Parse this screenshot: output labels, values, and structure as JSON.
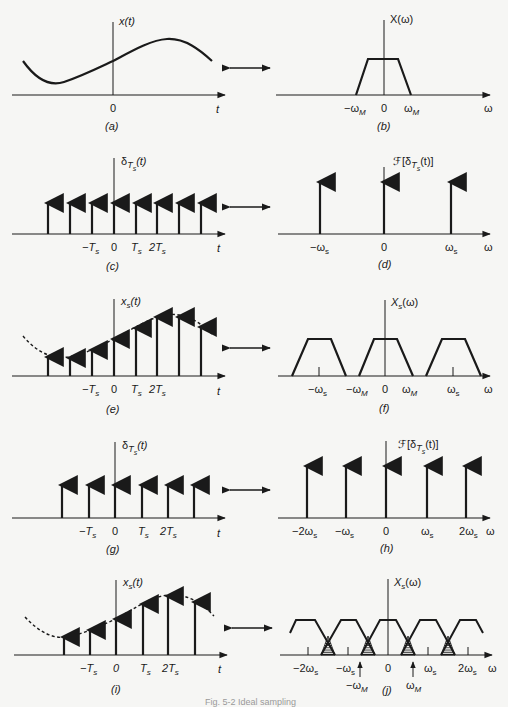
{
  "figure": {
    "caption": "Fig. 5-2 Ideal sampling",
    "colors": {
      "ink": "#1a1a1a",
      "background": "#f6f6f4",
      "hatch": "#1a1a1a"
    },
    "transform_arrow": "double-arrow",
    "panels": [
      {
        "id": "a",
        "label": "(a)",
        "domain": "time",
        "ylabel": "x(t)",
        "xlabel": "t",
        "ticks": [
          "0"
        ],
        "content": "continuous signal x(t), sinusoid-like curve"
      },
      {
        "id": "b",
        "label": "(b)",
        "domain": "frequency",
        "ylabel": "X(ω)",
        "xlabel": "ω",
        "ticks": [
          "−ωM",
          "0",
          "ωM"
        ],
        "content": "band-limited trapezoidal spectrum from −ωM to ωM"
      },
      {
        "id": "c",
        "label": "(c)",
        "domain": "time",
        "ylabel": "δTs(t)",
        "xlabel": "t",
        "ticks": [
          "−Ts",
          "0",
          "Ts",
          "2Ts"
        ],
        "content": "impulse train with period Ts (8 impulses shown)"
      },
      {
        "id": "d",
        "label": "(d)",
        "domain": "frequency",
        "ylabel": "ℱ[δTs(t)]",
        "xlabel": "ω",
        "ticks": [
          "−ωs",
          "0",
          "ωs"
        ],
        "content": "impulse train in frequency with spacing ωs (3 impulses)"
      },
      {
        "id": "e",
        "label": "(e)",
        "domain": "time",
        "ylabel": "xs(t)",
        "xlabel": "t",
        "ticks": [
          "−Ts",
          "0",
          "Ts",
          "2Ts"
        ],
        "content": "sampled signal: impulses weighted by x(t), envelope dashed"
      },
      {
        "id": "f",
        "label": "(f)",
        "domain": "frequency",
        "ylabel": "Xs(ω)",
        "xlabel": "ω",
        "ticks": [
          "−ωs",
          "−ωM",
          "0",
          "ωM",
          "ωs"
        ],
        "content": "replicated spectra at multiples of ωs, no overlap"
      },
      {
        "id": "g",
        "label": "(g)",
        "domain": "time",
        "ylabel": "δTs(t)",
        "xlabel": "t",
        "ticks": [
          "−Ts",
          "0",
          "Ts",
          "2Ts"
        ],
        "content": "impulse train with larger period Ts (6 impulses)"
      },
      {
        "id": "h",
        "label": "(h)",
        "domain": "frequency",
        "ylabel": "ℱ[δTs(t)]",
        "xlabel": "ω",
        "ticks": [
          "−2ωs",
          "−ωs",
          "0",
          "ωs",
          "2ωs"
        ],
        "content": "frequency impulse train with smaller spacing ωs (5 impulses)"
      },
      {
        "id": "i",
        "label": "(i)",
        "domain": "time",
        "ylabel": "xs(t)",
        "xlabel": "t",
        "ticks": [
          "−Ts",
          "0",
          "Ts",
          "2Ts"
        ],
        "content": "sampled signal with larger Ts, envelope dashed"
      },
      {
        "id": "j",
        "label": "(j)",
        "domain": "frequency",
        "ylabel": "Xs(ω)",
        "xlabel": "ω",
        "ticks": [
          "−2ωs",
          "−ωs",
          "0",
          "ωs",
          "2ωs"
        ],
        "markers": [
          "−ωM",
          "ωM"
        ],
        "content": "overlapping replicated spectra (aliasing), overlap regions hatched"
      }
    ]
  },
  "text": {
    "t": "t",
    "w": "ω",
    "zero": "0",
    "x_t": "x(t)",
    "X_w": "X(ω)",
    "delta": "δ",
    "Ts_sub_T": "T",
    "Ts_sub_s": "s",
    "paren_t": "(t)",
    "F_open": "ℱ[δ",
    "F_close": "(t)]",
    "xs": "x",
    "Xs": "X",
    "s": "s",
    "paren_w": "(ω)",
    "minus": "−",
    "T": "T",
    "two": "2",
    "omega": "ω",
    "M": "M",
    "labels": {
      "a": "(a)",
      "b": "(b)",
      "c": "(c)",
      "d": "(d)",
      "e": "(e)",
      "f": "(f)",
      "g": "(g)",
      "h": "(h)",
      "i": "(i)",
      "j": "(j)"
    },
    "caption": "Fig. 5-2 Ideal sampling"
  }
}
